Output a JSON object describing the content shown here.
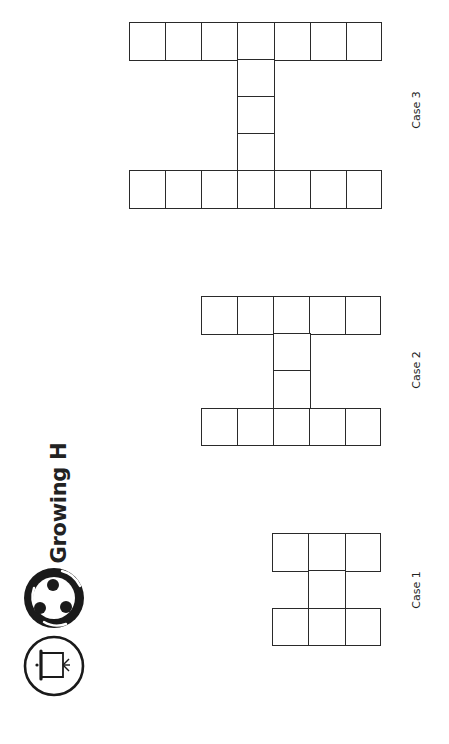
{
  "header": {
    "title": "Growing H",
    "icons": [
      {
        "name": "collaboration-icon",
        "description": "three people in a circle"
      },
      {
        "name": "presentation-icon",
        "description": "projector screen in a circle"
      }
    ]
  },
  "colors": {
    "ink": "#2a2a2a",
    "background": "#ffffff"
  },
  "cases": [
    {
      "label": "Case 1",
      "bar_squares": 3,
      "stem_squares": 1,
      "total_squares": 7
    },
    {
      "label": "Case 2",
      "bar_squares": 5,
      "stem_squares": 2,
      "total_squares": 12
    },
    {
      "label": "Case 3",
      "bar_squares": 7,
      "stem_squares": 3,
      "total_squares": 17
    }
  ]
}
